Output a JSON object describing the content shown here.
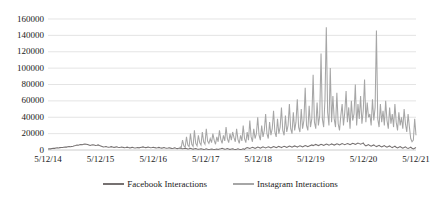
{
  "chart_data": {
    "type": "line",
    "title": "",
    "xlabel": "",
    "ylabel": "",
    "grid": true,
    "legend_position": "bottom",
    "ylim": [
      0,
      160000
    ],
    "yticks": [
      0,
      20000,
      40000,
      60000,
      80000,
      100000,
      120000,
      140000,
      160000
    ],
    "ytick_labels": [
      "0",
      "20000",
      "40000",
      "60000",
      "80000",
      "100000",
      "120000",
      "140000",
      "160000"
    ],
    "xlim": [
      "5/12/14",
      "5/12/21"
    ],
    "xticks": [
      "5/12/14",
      "5/12/15",
      "5/12/16",
      "5/12/17",
      "5/12/18",
      "5/12/19",
      "5/12/20",
      "5/12/21"
    ],
    "colors": {
      "facebook": "#767171",
      "instagram": "#a6a6a6",
      "gridline": "#d9d9d9"
    },
    "series": [
      {
        "name": "Facebook Interactions",
        "color": "#767171",
        "values": [
          1200,
          1500,
          1400,
          1800,
          2100,
          2000,
          2400,
          2600,
          2500,
          2900,
          3100,
          3000,
          3400,
          3600,
          3500,
          3900,
          4200,
          4000,
          4400,
          4700,
          5100,
          5600,
          6200,
          5900,
          6400,
          6800,
          6500,
          7000,
          7400,
          7100,
          6800,
          6200,
          5600,
          6100,
          6500,
          6000,
          5500,
          5800,
          6200,
          5400,
          4800,
          4200,
          3600,
          3900,
          4300,
          3800,
          3400,
          3700,
          4100,
          3600,
          3200,
          3500,
          3900,
          3400,
          3000,
          3300,
          3700,
          3200,
          2800,
          3100,
          3500,
          3000,
          2600,
          2900,
          3300,
          2800,
          2400,
          2700,
          3100,
          2600,
          3000,
          3400,
          3800,
          3300,
          2900,
          3200,
          3600,
          3100,
          2700,
          3000,
          3400,
          2900,
          2500,
          2800,
          3200,
          2700,
          2300,
          2600,
          3000,
          2500,
          2100,
          2400,
          2800,
          2300,
          1900,
          2200,
          2600,
          2100,
          1700,
          2000,
          2400,
          1900,
          1500,
          1800,
          2200,
          1700,
          1300,
          1600,
          2000,
          1500,
          1100,
          1400,
          1800,
          1300,
          900,
          1200,
          1600,
          1100,
          700,
          1000,
          1400,
          900,
          600,
          900,
          1300,
          800,
          500,
          800,
          1200,
          700,
          1100,
          1500,
          2000,
          1400,
          900,
          1300,
          1800,
          1200,
          800,
          1100,
          1600,
          1000,
          700,
          1000,
          1500,
          900,
          600,
          900,
          1400,
          800,
          2200,
          3000,
          2400,
          1800,
          2600,
          3400,
          2800,
          2000,
          2800,
          3600,
          3000,
          2200,
          3000,
          3800,
          3200,
          2400,
          3200,
          4000,
          3400,
          2600,
          3400,
          4200,
          3600,
          2800,
          3600,
          4400,
          3800,
          3000,
          3800,
          4600,
          4000,
          3200,
          4000,
          4800,
          4200,
          3400,
          4200,
          5000,
          4400,
          3600,
          4400,
          5200,
          4600,
          3800,
          4600,
          5400,
          4800,
          4000,
          4800,
          5600,
          6200,
          5400,
          6000,
          6800,
          6200,
          5400,
          6200,
          7000,
          6400,
          5600,
          6400,
          7200,
          6600,
          5800,
          6600,
          7400,
          6800,
          6000,
          6800,
          7600,
          7000,
          6200,
          7000,
          7800,
          7200,
          6400,
          7200,
          8000,
          7400,
          6600,
          7400,
          8200,
          7600,
          6800,
          7600,
          8400,
          7800,
          7000,
          7800,
          8600,
          6200,
          5000,
          5800,
          6600,
          5400,
          4600,
          5400,
          6200,
          5000,
          4200,
          5000,
          5800,
          4600,
          3800,
          4600,
          5400,
          4200,
          3400,
          4200,
          5000,
          3800,
          3000,
          3800,
          4600,
          3400,
          2600,
          3400,
          4200,
          3000,
          2200,
          3000,
          3800,
          2600,
          1800,
          2600,
          3400,
          2200,
          1400,
          2200,
          3000
        ]
      },
      {
        "name": "Instagram Interactions",
        "color": "#a6a6a6",
        "values": [
          null,
          null,
          null,
          null,
          null,
          null,
          null,
          null,
          null,
          null,
          null,
          null,
          null,
          null,
          null,
          null,
          null,
          null,
          null,
          null,
          null,
          null,
          null,
          null,
          null,
          null,
          null,
          null,
          null,
          null,
          null,
          null,
          null,
          null,
          null,
          null,
          null,
          null,
          null,
          null,
          null,
          null,
          null,
          null,
          null,
          null,
          null,
          null,
          null,
          null,
          null,
          null,
          null,
          null,
          null,
          null,
          null,
          null,
          null,
          null,
          null,
          null,
          null,
          null,
          null,
          null,
          null,
          null,
          null,
          null,
          null,
          null,
          null,
          null,
          null,
          null,
          null,
          null,
          null,
          null,
          null,
          null,
          null,
          null,
          null,
          null,
          null,
          null,
          null,
          null,
          null,
          null,
          null,
          null,
          null,
          null,
          null,
          null,
          null,
          null,
          4200,
          3000,
          12000,
          5000,
          3400,
          16000,
          6000,
          4000,
          20000,
          7000,
          4500,
          24000,
          8000,
          5000,
          18000,
          9000,
          6000,
          22000,
          10000,
          7000,
          26000,
          11000,
          8000,
          14000,
          9000,
          20000,
          12000,
          7000,
          16000,
          10000,
          24000,
          13000,
          8000,
          18000,
          11000,
          28000,
          14000,
          9000,
          20000,
          12000,
          22000,
          15000,
          10000,
          26000,
          13000,
          8000,
          18000,
          11000,
          30000,
          14000,
          9000,
          22000,
          12000,
          36000,
          16000,
          10000,
          26000,
          14000,
          20000,
          40000,
          18000,
          12000,
          30000,
          16000,
          24000,
          44000,
          20000,
          14000,
          34000,
          18000,
          26000,
          48000,
          22000,
          16000,
          38000,
          20000,
          28000,
          52000,
          24000,
          18000,
          42000,
          22000,
          30000,
          56000,
          26000,
          20000,
          46000,
          24000,
          34000,
          62000,
          28000,
          22000,
          50000,
          26000,
          36000,
          76000,
          30000,
          24000,
          54000,
          28000,
          38000,
          92000,
          34000,
          26000,
          58000,
          30000,
          42000,
          118000,
          38000,
          28000,
          62000,
          150000,
          46000,
          30000,
          100000,
          34000,
          66000,
          38000,
          28000,
          70000,
          32000,
          24000,
          42000,
          56000,
          30000,
          46000,
          72000,
          34000,
          52000,
          26000,
          60000,
          36000,
          44000,
          80000,
          30000,
          56000,
          38000,
          66000,
          32000,
          48000,
          86000,
          34000,
          58000,
          40000,
          44000,
          30000,
          62000,
          36000,
          52000,
          146000,
          38000,
          28000,
          56000,
          34000,
          48000,
          30000,
          60000,
          36000,
          26000,
          52000,
          32000,
          44000,
          28000,
          56000,
          34000,
          24000,
          46000,
          30000,
          40000,
          26000,
          50000,
          32000,
          22000,
          44000,
          28000,
          14000,
          10000,
          12000,
          38000,
          18000
        ]
      }
    ]
  }
}
